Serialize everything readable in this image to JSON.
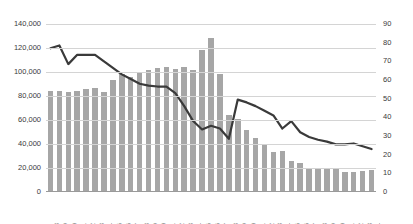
{
  "chart_data": {
    "type": "bar",
    "title": "",
    "xlabel": "",
    "ylabel": "",
    "grid": true,
    "legend": "none",
    "categories": [
      "1978",
      "1979",
      "1980",
      "1981",
      "1982",
      "1983",
      "1984",
      "1985",
      "1986",
      "1987",
      "1988",
      "1989",
      "1990",
      "1991",
      "1992",
      "1993",
      "1994",
      "1995",
      "1996",
      "1997",
      "1998",
      "1999",
      "2000",
      "2001",
      "2002",
      "2003",
      "2004",
      "2005",
      "2006",
      "2007",
      "2008",
      "2009",
      "2010",
      "2011",
      "2012",
      "2013",
      "2014"
    ],
    "series": [
      {
        "name": "bars",
        "type": "bar",
        "axis": "left",
        "ylim": [
          0,
          140000
        ],
        "yticks": [
          0,
          20000,
          40000,
          60000,
          80000,
          100000,
          120000,
          140000
        ],
        "ytick_labels": [
          "0",
          "20,000",
          "40,000",
          "60,000",
          "80,000",
          "100,000",
          "120,000",
          "140,000"
        ],
        "color": "#a6a6a6",
        "values": [
          84000,
          84500,
          83000,
          84500,
          86000,
          87000,
          83500,
          93000,
          98000,
          96000,
          99500,
          101500,
          103500,
          104500,
          102500,
          104500,
          102000,
          118000,
          128000,
          98000,
          64500,
          61000,
          52000,
          45000,
          40000,
          33000,
          34500,
          26000,
          24500,
          20000,
          20000,
          20000,
          19500,
          16500,
          17000,
          17500,
          18500
        ]
      },
      {
        "name": "line",
        "type": "line",
        "axis": "right",
        "ylim": [
          0,
          90
        ],
        "yticks": [
          0,
          10,
          20,
          30,
          40,
          50,
          60,
          70,
          80,
          90
        ],
        "ytick_labels": [
          "0",
          "10",
          "20",
          "30",
          "40",
          "50",
          "60",
          "70",
          "80",
          "90"
        ],
        "color": "#3a3a3a",
        "values": [
          77.0,
          78.5,
          68.5,
          73.5,
          73.5,
          73.5,
          70.0,
          66.5,
          63.0,
          60.5,
          58.0,
          57.0,
          56.5,
          56.5,
          53.0,
          46.0,
          38.0,
          33.5,
          35.5,
          34.0,
          28.5,
          49.5,
          48.0,
          46.0,
          43.5,
          41.0,
          34.0,
          38.0,
          32.0,
          29.5,
          28.0,
          27.0,
          25.5,
          25.5,
          26.0,
          24.5,
          23.0
        ]
      }
    ]
  }
}
